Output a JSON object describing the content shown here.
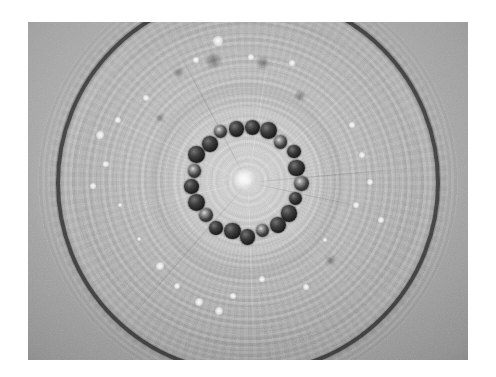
{
  "image": {
    "kind": "scientific-micrograph",
    "subject": "circular specimen disc with concentric ring texture and an inner ring of dark spherical particles",
    "color_mode": "grayscale",
    "canvas_width_px": 496,
    "canvas_height_px": 377,
    "plate": {
      "left_px": 28,
      "top_px": 22,
      "width_px": 440,
      "height_px": 338,
      "border_color": "#ffffff",
      "background_color": "#a9a9a9"
    },
    "features": {
      "outer_hoop": {
        "label": "outer dark circular hoop",
        "center_x_px": 248,
        "center_y_px": 182,
        "radius_px": 188,
        "stroke_color": "#2c2c2c",
        "stroke_width_px": 4.5
      },
      "bright_halo": {
        "label": "bright annular halo around centre",
        "center_x_px": 246,
        "center_y_px": 181,
        "radius_px": 78,
        "color": "#ffffff"
      },
      "bead_ring": {
        "label": "ring of dark spherical beads",
        "center_x_px": 246,
        "center_y_px": 181,
        "radius_px": 54,
        "bead_count": 21,
        "bead_diameter_px": 15,
        "bead_color": "#1d1d1d",
        "highlight_color": "#d8d8d8",
        "lit_bead_indices": [
          2,
          5,
          9,
          13,
          16,
          19
        ]
      },
      "center_core": {
        "label": "bright central speck",
        "center_x_px": 245,
        "center_y_px": 180,
        "radius_px": 11,
        "color": "#ffffff"
      }
    },
    "white_specks": [
      {
        "x": 218,
        "y": 41,
        "r": 3.6
      },
      {
        "x": 251,
        "y": 57,
        "r": 2.2
      },
      {
        "x": 196,
        "y": 60,
        "r": 2.0
      },
      {
        "x": 292,
        "y": 63,
        "r": 2.0
      },
      {
        "x": 146,
        "y": 98,
        "r": 2.6
      },
      {
        "x": 118,
        "y": 120,
        "r": 2.4
      },
      {
        "x": 100,
        "y": 135,
        "r": 2.8
      },
      {
        "x": 106,
        "y": 164,
        "r": 2.0
      },
      {
        "x": 93,
        "y": 186,
        "r": 2.0
      },
      {
        "x": 120,
        "y": 205,
        "r": 1.8
      },
      {
        "x": 352,
        "y": 125,
        "r": 2.6
      },
      {
        "x": 362,
        "y": 155,
        "r": 2.0
      },
      {
        "x": 370,
        "y": 182,
        "r": 2.4
      },
      {
        "x": 356,
        "y": 205,
        "r": 2.0
      },
      {
        "x": 381,
        "y": 220,
        "r": 2.2
      },
      {
        "x": 160,
        "y": 266,
        "r": 3.0
      },
      {
        "x": 177,
        "y": 286,
        "r": 2.4
      },
      {
        "x": 199,
        "y": 302,
        "r": 3.2
      },
      {
        "x": 233,
        "y": 296,
        "r": 2.2
      },
      {
        "x": 219,
        "y": 311,
        "r": 3.0
      },
      {
        "x": 262,
        "y": 279,
        "r": 2.0
      },
      {
        "x": 306,
        "y": 287,
        "r": 2.0
      },
      {
        "x": 139,
        "y": 239,
        "r": 1.8
      },
      {
        "x": 325,
        "y": 240,
        "r": 1.8
      }
    ],
    "dark_specks": [
      {
        "x": 213,
        "y": 60,
        "r": 5.0
      },
      {
        "x": 263,
        "y": 63,
        "r": 4.0
      },
      {
        "x": 178,
        "y": 72,
        "r": 3.0
      },
      {
        "x": 300,
        "y": 96,
        "r": 3.2
      },
      {
        "x": 160,
        "y": 118,
        "r": 2.6
      },
      {
        "x": 330,
        "y": 260,
        "r": 3.0
      }
    ],
    "hairlines": [
      {
        "angle_deg": 12,
        "length_px": 150
      },
      {
        "angle_deg": 47,
        "length_px": 170
      },
      {
        "angle_deg": 88,
        "length_px": 160
      },
      {
        "angle_deg": 131,
        "length_px": 175
      },
      {
        "angle_deg": 168,
        "length_px": 150
      },
      {
        "angle_deg": 205,
        "length_px": 168
      },
      {
        "angle_deg": 242,
        "length_px": 158
      },
      {
        "angle_deg": 279,
        "length_px": 172
      },
      {
        "angle_deg": 318,
        "length_px": 162
      },
      {
        "angle_deg": 355,
        "length_px": 148
      }
    ]
  }
}
